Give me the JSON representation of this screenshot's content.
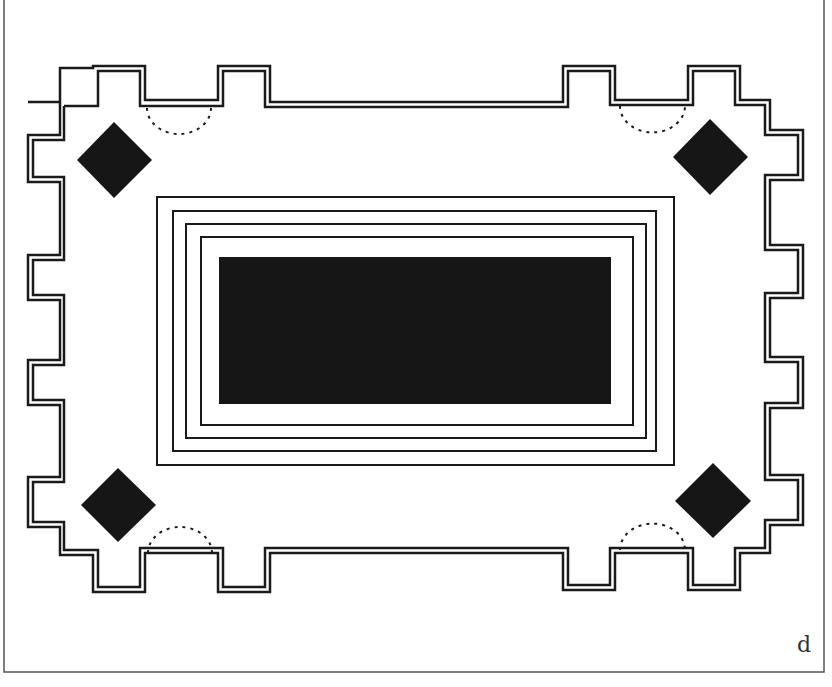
{
  "figure": {
    "panel_label": "d",
    "colors": {
      "ink": "#1a1a1a",
      "fill": "#161616",
      "background": "#ffffff",
      "frame": "#555555"
    },
    "elements": {
      "outer_wall": "crenellated double-line enclosure",
      "corner_markers": [
        "top-left diamond",
        "top-right diamond",
        "bottom-left diamond",
        "bottom-right diamond"
      ],
      "door_arcs": [
        "top-left dashed arc",
        "top-right dashed arc",
        "bottom-left dashed arc",
        "bottom-right dashed arc"
      ],
      "inner_frames_count": 4,
      "central_block": "solid black rectangle"
    }
  }
}
